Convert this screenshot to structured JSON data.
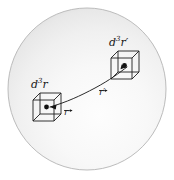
{
  "figure": {
    "name": "volume-element-pair-in-sphere",
    "width": 174,
    "height": 180,
    "background_color": "#ffffff"
  },
  "sphere": {
    "name": "sphere-body",
    "center_x": 87,
    "center_y": 89,
    "radius_x": 79,
    "radius_y": 81,
    "fill_light": "#fdfdfd",
    "fill_mid": "#f2f2f2",
    "fill_dark": "#e2e2e2",
    "stroke_color": "#b9b9b9",
    "stroke_width": 1
  },
  "elements": [
    {
      "id": "lower-left",
      "name": "volume-element-d3r",
      "label": "d",
      "label_exponent": "3",
      "label_var": "r",
      "label_full": "d³r",
      "label_x": 33,
      "label_y": 81,
      "cube_x": 32,
      "cube_y": 95,
      "cube_size": 22,
      "cube_depth": 8,
      "dot_color": "#111111"
    },
    {
      "id": "upper-right",
      "name": "volume-element-d3rprime",
      "label": "d",
      "label_exponent": "3",
      "label_var": "r′",
      "label_full": "d³r′",
      "label_x": 111,
      "label_y": 41,
      "cube_x": 111,
      "cube_y": 55,
      "cube_size": 22,
      "cube_depth": 8,
      "dot_color": "#111111"
    }
  ],
  "vectors": [
    {
      "id": "r",
      "name": "position-vector-r",
      "label": "r",
      "label_x": 66,
      "label_y": 103,
      "has_arrow_accent": true
    },
    {
      "id": "r-prime",
      "name": "position-vector-r-prime",
      "label": "r′",
      "label_x": 101,
      "label_y": 84,
      "has_arrow_accent": true
    }
  ],
  "connector": {
    "name": "separation-curve",
    "stroke_color": "#2b2b2b",
    "stroke_width": 1,
    "path": "M 48 108 C 66 103, 80 96, 95 88 C 110 80, 118 72, 126 66"
  }
}
